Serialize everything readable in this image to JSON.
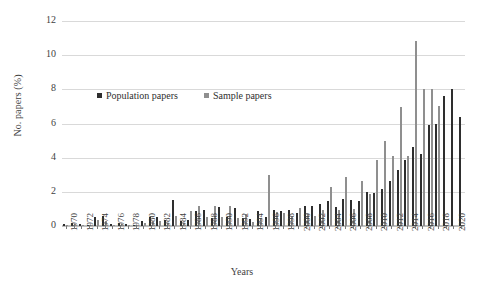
{
  "chart_data": {
    "type": "bar",
    "title": "",
    "subtitle": "",
    "xlabel": "Years",
    "ylabel": "No. papers (%)",
    "ylim": [
      0,
      12
    ],
    "ytick_values": [
      0,
      2,
      4,
      6,
      8,
      10,
      12
    ],
    "ytick_labels": [
      "0",
      "2",
      "4",
      "6",
      "8",
      "10",
      "12"
    ],
    "grid": true,
    "grid_axis": "y",
    "legend_position": "upper-left-inside",
    "xtick_label_rotation": -90,
    "xtick_label_step": 2,
    "categories": [
      "1970",
      "1971",
      "1972",
      "1973",
      "1974",
      "1975",
      "1976",
      "1977",
      "1978",
      "1979",
      "1980",
      "1981",
      "1982",
      "1983",
      "1984",
      "1985",
      "1986",
      "1987",
      "1988",
      "1989",
      "1990",
      "1991",
      "1992",
      "1993",
      "1994",
      "1995",
      "1996",
      "1997",
      "1998",
      "1999",
      "2000",
      "2001",
      "2002",
      "2003",
      "2004",
      "2005",
      "2006",
      "2007",
      "2008",
      "2009",
      "2010",
      "2011",
      "2012",
      "2013",
      "2014",
      "2015",
      "2016",
      "2017",
      "2018",
      "2019",
      "2020",
      "2021"
    ],
    "xtick_labels_shown": [
      "1970",
      "1972",
      "1974",
      "1976",
      "1978",
      "1980",
      "1982",
      "1984",
      "1986",
      "1988",
      "1990",
      "1992",
      "1994",
      "1996",
      "1998",
      "2000",
      "2002",
      "2004",
      "2006",
      "2008",
      "2010",
      "2012",
      "2014",
      "2016",
      "2018",
      "2020"
    ],
    "series": [
      {
        "name": "Population papers",
        "color": "#2e2e2e",
        "values": [
          0.1,
          0.15,
          0.1,
          0.05,
          0.55,
          0.6,
          0.1,
          0.15,
          0.1,
          0.05,
          0.3,
          0.55,
          0.55,
          0.35,
          1.5,
          0.3,
          0.35,
          0.85,
          0.95,
          0.45,
          1.1,
          0.5,
          1.05,
          0.45,
          0.4,
          0.85,
          0.55,
          0.95,
          0.9,
          0.95,
          0.75,
          1.15,
          1.2,
          1.3,
          1.45,
          1.1,
          1.6,
          1.5,
          1.45,
          2.0,
          1.95,
          2.15,
          2.65,
          3.25,
          3.85,
          4.6,
          4.2,
          5.9,
          6.0,
          7.6,
          8.0,
          6.4
        ]
      },
      {
        "name": "Sample papers",
        "color": "#8f8f8f",
        "values": [
          0.05,
          0.1,
          0.05,
          0.05,
          0.35,
          0.3,
          0.05,
          0.1,
          0.05,
          0.05,
          0.2,
          0.25,
          0.3,
          0.2,
          0.6,
          0.2,
          0.85,
          1.2,
          0.55,
          1.15,
          0.5,
          1.2,
          0.45,
          0.7,
          0.25,
          0.45,
          3.0,
          0.8,
          0.75,
          0.55,
          1.05,
          0.7,
          0.6,
          0.95,
          2.3,
          0.95,
          2.85,
          1.0,
          2.65,
          1.85,
          3.85,
          4.95,
          4.1,
          6.95,
          4.1,
          10.85,
          8.0,
          8.0,
          7.0,
          0.0,
          0.0,
          0.0
        ]
      }
    ]
  },
  "legend": {
    "items": [
      {
        "label": "Population papers"
      },
      {
        "label": "Sample papers"
      }
    ]
  }
}
